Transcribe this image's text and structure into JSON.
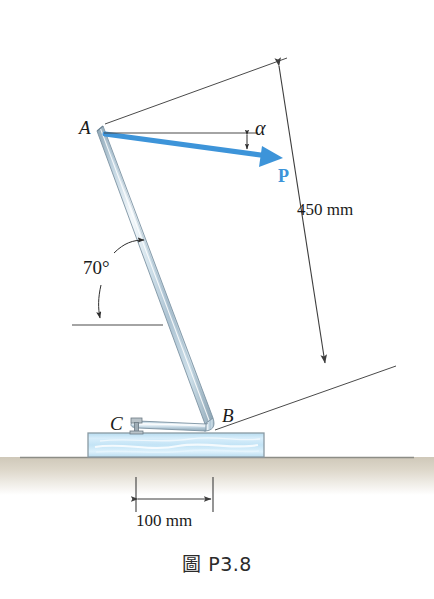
{
  "figure": {
    "caption": "圖 P3.8",
    "background_color": "#ffffff"
  },
  "labels": {
    "point_a": "A",
    "point_b": "B",
    "point_c": "C",
    "force": "P",
    "angle_alpha": "α",
    "angle_70": "70°",
    "dim_450": "450 mm",
    "dim_100": "100 mm"
  },
  "colors": {
    "force_arrow": "#3d94d9",
    "rod_fill": "#c7d9e4",
    "rod_highlight": "#eef5f9",
    "rod_edge": "#7d93a3",
    "block_fill": "#cfe8f6",
    "block_edge": "#8a9aa3",
    "ground_fill": "#d9d3c6",
    "line_color": "#4a4a4a",
    "text_color": "#1a1a1a"
  },
  "geometry": {
    "point_a": {
      "x": 104,
      "y": 128
    },
    "point_b": {
      "x": 213,
      "y": 428
    },
    "point_c": {
      "x": 136,
      "y": 428
    },
    "rod_angle_degrees": 70,
    "rod_length_mm": 450,
    "bc_length_mm": 100,
    "force_tip": {
      "x": 277,
      "y": 160
    },
    "block": {
      "x": 88,
      "y": 432,
      "width": 176,
      "height": 25
    },
    "ground_y": 457
  },
  "annotations": {
    "dim_450_from": {
      "x": 283,
      "y": 64
    },
    "dim_450_to": {
      "x": 322,
      "y": 364
    },
    "dim_100_left": {
      "x": 136,
      "y": 487
    },
    "dim_100_right": {
      "x": 213,
      "y": 487
    },
    "reference_line_y": 133,
    "horizontal_ref_70_y": 325
  }
}
